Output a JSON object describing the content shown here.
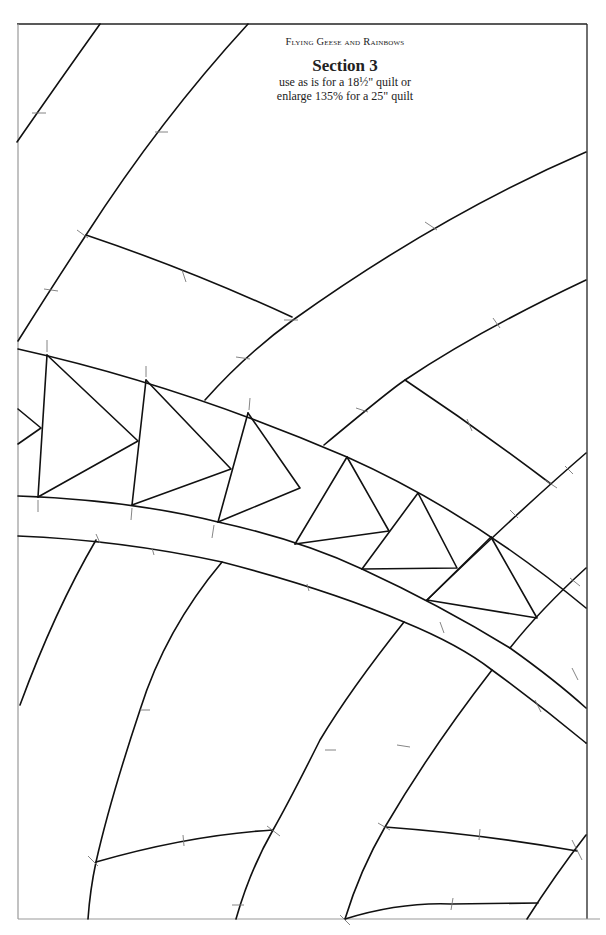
{
  "header": {
    "series_title": "Flying Geese and Rainbows",
    "section_title": "Section 3",
    "instruction_line1": "use as is for a 18½\" quilt or",
    "instruction_line2": "enlarge 135% for a 25\" quilt"
  },
  "pattern": {
    "type": "quilt-foundation-pattern",
    "line_color": "#111111",
    "mark_color": "#777777",
    "flying_geese_count_visible": 7
  }
}
